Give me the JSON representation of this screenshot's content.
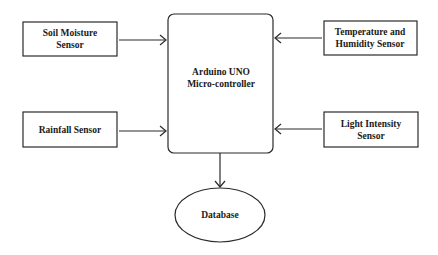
{
  "diagram": {
    "colors": {
      "stroke": "#2a2a2a",
      "text": "#1a1a1a",
      "background": "#ffffff"
    },
    "nodes": [
      {
        "id": "soil",
        "shape": "rect",
        "lines": [
          "Soil Moisture",
          "Sensor"
        ],
        "x": 23,
        "y": 22,
        "w": 94,
        "h": 34
      },
      {
        "id": "temp",
        "shape": "rect",
        "lines": [
          "Temperature and",
          "Humidity Sensor"
        ],
        "x": 324,
        "y": 21,
        "w": 93,
        "h": 34
      },
      {
        "id": "rain",
        "shape": "rect",
        "lines": [
          "Rainfall Sensor"
        ],
        "x": 23,
        "y": 112,
        "w": 94,
        "h": 35
      },
      {
        "id": "light",
        "shape": "rect",
        "lines": [
          "Light Intensity",
          "Sensor"
        ],
        "x": 324,
        "y": 112,
        "w": 94,
        "h": 35
      },
      {
        "id": "arduino",
        "shape": "rounded-rect",
        "lines": [
          "Arduino UNO",
          "Micro-controller"
        ],
        "x": 168,
        "y": 14,
        "w": 105,
        "h": 139
      },
      {
        "id": "db",
        "shape": "ellipse",
        "lines": [
          "Database"
        ],
        "cx": 220,
        "cy": 215,
        "rx": 45,
        "ry": 27
      }
    ],
    "edges": [
      {
        "from": "soil",
        "to": "arduino"
      },
      {
        "from": "rain",
        "to": "arduino"
      },
      {
        "from": "temp",
        "to": "arduino"
      },
      {
        "from": "light",
        "to": "arduino"
      },
      {
        "from": "arduino",
        "to": "db"
      }
    ],
    "labels": {
      "soil_1": "Soil Moisture",
      "soil_2": "Sensor",
      "temp_1": "Temperature and",
      "temp_2": "Humidity Sensor",
      "rain_1": "Rainfall Sensor",
      "light_1": "Light Intensity",
      "light_2": "Sensor",
      "arduino_1": "Arduino UNO",
      "arduino_2": "Micro-controller",
      "db_1": "Database"
    }
  }
}
